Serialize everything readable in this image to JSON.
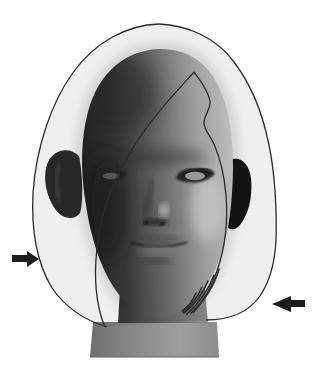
{
  "figure": {
    "name": "hairstyle-silhouette-diagram",
    "left_arrow_icon": "arrow-right-icon",
    "right_arrow_icon": "arrow-left-icon"
  },
  "colors": {
    "background": "#ffffff",
    "outline": "#2b2b2b",
    "overlay_tint": "rgba(40,40,40,0.075)",
    "arrow": "#1d1d1d",
    "head_dark": "#1f1f1f",
    "head_shadow": "#3a3a3a",
    "head_mid": "#6e6e6e",
    "head_lit": "#a8a8a8",
    "head_light": "#c9c9c9",
    "ear_left": "#282828",
    "ear_right": "#121212",
    "neck_dark": "#303030",
    "neck_mid": "#6a6a6a",
    "neck_light": "#8f8f8f",
    "base_dark": "#6e6e6e",
    "base_mid": "#7e7e7e",
    "base_light": "#9e9e9e",
    "base_end": "#8e8e8e",
    "ambient_glow": "#c2c2c2"
  }
}
